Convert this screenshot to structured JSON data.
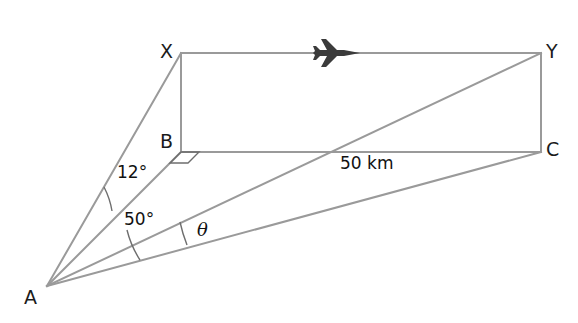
{
  "figure": {
    "type": "geometry-diagram",
    "width": 578,
    "height": 323,
    "background_color": "#ffffff",
    "line_color": "#9a9a9a",
    "arc_color": "#6e6e6e",
    "text_color": "#111111",
    "plane_color": "#3b3b3b"
  },
  "vertices": {
    "X": {
      "label": "X",
      "x": 181,
      "y": 53
    },
    "Y": {
      "label": "Y",
      "x": 541,
      "y": 53
    },
    "B": {
      "label": "B",
      "x": 181,
      "y": 152
    },
    "C": {
      "label": "C",
      "x": 541,
      "y": 152
    },
    "A": {
      "label": "A",
      "x": 47,
      "y": 286
    }
  },
  "angles": {
    "upper": {
      "label": "12°",
      "value": 12,
      "unit": "degrees",
      "between": "AX and AB"
    },
    "lower": {
      "label": "50°",
      "value": 50,
      "unit": "degrees",
      "between": "AB and AC"
    },
    "theta": {
      "label": "θ",
      "value": null,
      "unit": "degrees",
      "between": "AY and AC"
    }
  },
  "measurements": {
    "distance_xy": {
      "label": "50 km",
      "value": 50,
      "unit": "km",
      "along": "XY / BC"
    }
  },
  "icons": {
    "airplane": {
      "name": "airplane-icon",
      "x": 340,
      "y": 53,
      "heading": "right"
    }
  },
  "edges": [
    {
      "name": "edge-X-Y",
      "from": "X",
      "to": "Y"
    },
    {
      "name": "edge-X-B",
      "from": "X",
      "to": "B"
    },
    {
      "name": "edge-B-C",
      "from": "B",
      "to": "C"
    },
    {
      "name": "edge-Y-C",
      "from": "Y",
      "to": "C"
    },
    {
      "name": "edge-B-Y",
      "from": "B",
      "to": "Y"
    },
    {
      "name": "edge-A-X",
      "from": "A",
      "to": "X"
    },
    {
      "name": "edge-A-B",
      "from": "A",
      "to": "B"
    },
    {
      "name": "edge-A-Y",
      "from": "A",
      "to": "Y"
    },
    {
      "name": "edge-A-C",
      "from": "A",
      "to": "C"
    }
  ],
  "markers": {
    "right_angle_at_B": {
      "name": "right-angle-marker",
      "vertex": "B"
    }
  }
}
